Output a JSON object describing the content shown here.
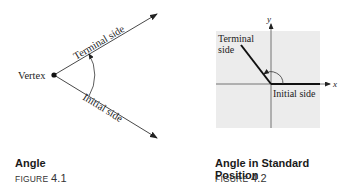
{
  "figures": [
    {
      "title": "Angle",
      "figure_label": "FIGURE",
      "figure_number": "4.1",
      "labels": {
        "vertex": "Vertex",
        "terminal": "Terminal side",
        "initial": "Initial side"
      }
    },
    {
      "title": "Angle in Standard Position",
      "figure_label": "FIGURE",
      "figure_number": "4.2",
      "labels": {
        "terminal_line1": "Terminal",
        "terminal_line2": "side",
        "initial": "Initial side",
        "x_axis": "x",
        "y_axis": "y"
      },
      "background_color": "#ececec"
    }
  ]
}
